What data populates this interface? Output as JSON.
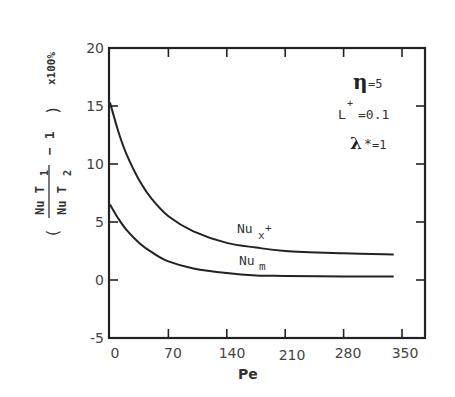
{
  "chart_data": {
    "type": "line",
    "title": "",
    "xlabel": "Pe",
    "ylabel": "( Nu T1 / Nu T2 − 1 ) x100%",
    "ylabel_parts": {
      "open": "(",
      "num": "Nu T",
      "num_sub": "1",
      "den": "Nu T",
      "den_sub": "2",
      "minus_one": "− 1",
      "close": ")",
      "scale": "x100%"
    },
    "xlim": [
      0,
      350
    ],
    "ylim": [
      -5,
      20
    ],
    "x_ticks": [
      "0",
      "70",
      "140",
      "210",
      "280",
      "350"
    ],
    "y_ticks": [
      "20",
      "15",
      "10",
      "5",
      "0",
      "-5"
    ],
    "grid": false,
    "x": [
      0,
      10,
      20,
      35,
      50,
      70,
      100,
      140,
      175,
      210,
      280,
      340
    ],
    "series": [
      {
        "name": "Nu_x+",
        "label_main": "Nu",
        "label_sub": "x",
        "label_sup": "+",
        "values": [
          15.3,
          12.8,
          10.8,
          8.6,
          7.0,
          5.5,
          4.2,
          3.2,
          2.8,
          2.5,
          2.3,
          2.2
        ]
      },
      {
        "name": "Nu_m",
        "label_main": "Nu",
        "label_sub": "m",
        "values": [
          6.5,
          5.3,
          4.3,
          3.2,
          2.4,
          1.6,
          1.0,
          0.6,
          0.4,
          0.35,
          0.3,
          0.3
        ]
      }
    ],
    "annotations": [
      {
        "symbol": "η",
        "text": "=5"
      },
      {
        "symbol": "L",
        "sup": "+",
        "text": "=0.1"
      },
      {
        "symbol": "λ",
        "sup": "*",
        "text": "=1"
      }
    ]
  }
}
